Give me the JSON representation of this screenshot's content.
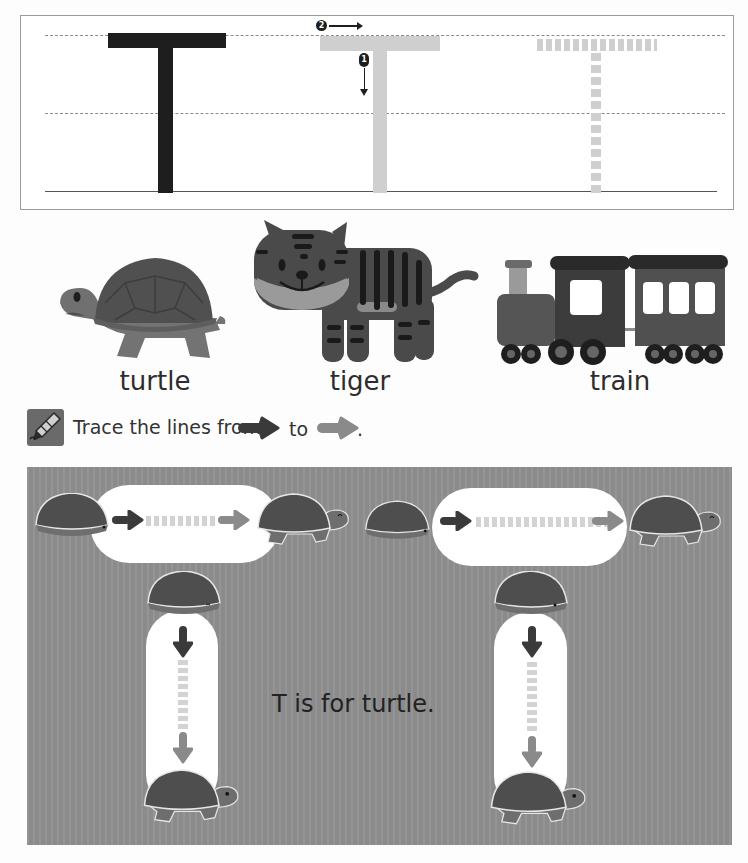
{
  "tracing": {
    "letter": "T",
    "stroke_numbers": [
      "1",
      "2"
    ],
    "model_color": "#1e1e1e",
    "guide_color": "#cfcfcf"
  },
  "words": [
    {
      "label": "turtle",
      "icon": "turtle-icon"
    },
    {
      "label": "tiger",
      "icon": "tiger-icon"
    },
    {
      "label": "train",
      "icon": "train-icon"
    }
  ],
  "instruction": {
    "text_before": "Trace the lines from",
    "text_middle": "to",
    "text_after": ".",
    "icon": "crayon-icon",
    "start_arrow_color": "#3a3a3a",
    "end_arrow_color": "#8a8a8a"
  },
  "panel": {
    "caption": "T is for turtle.",
    "background": "#8f8f8f"
  }
}
